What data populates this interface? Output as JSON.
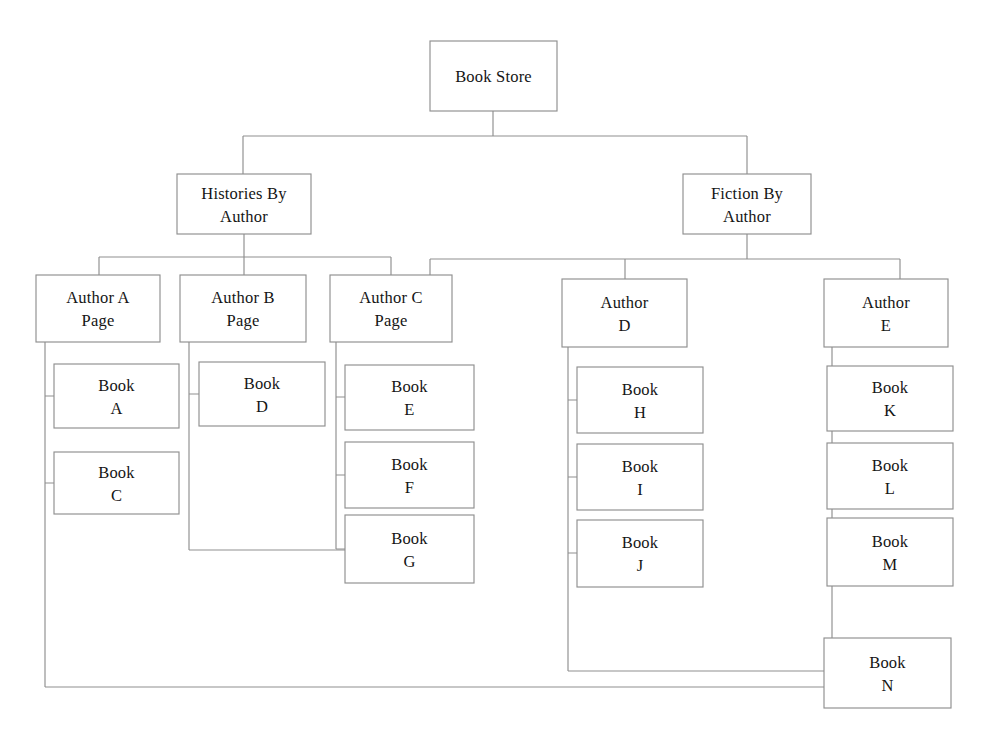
{
  "diagram": {
    "type": "tree-hierarchy",
    "background_color": "#ffffff",
    "box_fill_color": "#ffffff",
    "box_stroke_color": "#8f8f8f",
    "connector_color": "#8f8f8f",
    "text_color": "#151515",
    "nodes": [
      {
        "id": "book-store",
        "level": 0,
        "lines": [
          "Book Store"
        ],
        "x": 430,
        "y": 41,
        "w": 127,
        "h": 70
      },
      {
        "id": "histories-by-author",
        "level": 1,
        "lines": [
          "Histories By",
          "Author"
        ],
        "x": 177,
        "y": 174,
        "w": 134,
        "h": 60
      },
      {
        "id": "fiction-by-author",
        "level": 1,
        "lines": [
          "Fiction By",
          "Author"
        ],
        "x": 683,
        "y": 174,
        "w": 128,
        "h": 60
      },
      {
        "id": "author-a",
        "level": 2,
        "lines": [
          "Author A",
          "Page"
        ],
        "x": 36,
        "y": 275,
        "w": 124,
        "h": 67
      },
      {
        "id": "author-b",
        "level": 2,
        "lines": [
          "Author B",
          "Page"
        ],
        "x": 180,
        "y": 275,
        "w": 126,
        "h": 67
      },
      {
        "id": "author-c",
        "level": 2,
        "lines": [
          "Author C",
          "Page"
        ],
        "x": 330,
        "y": 275,
        "w": 122,
        "h": 67
      },
      {
        "id": "author-d",
        "level": 2,
        "lines": [
          "Author",
          "D"
        ],
        "x": 562,
        "y": 279,
        "w": 125,
        "h": 68
      },
      {
        "id": "author-e",
        "level": 2,
        "lines": [
          "Author",
          "E"
        ],
        "x": 824,
        "y": 279,
        "w": 124,
        "h": 68
      },
      {
        "id": "book-a",
        "level": 3,
        "lines": [
          "Book",
          "A"
        ],
        "x": 54,
        "y": 364,
        "w": 125,
        "h": 64
      },
      {
        "id": "book-c",
        "level": 3,
        "lines": [
          "Book",
          "C"
        ],
        "x": 54,
        "y": 452,
        "w": 125,
        "h": 62
      },
      {
        "id": "book-d",
        "level": 3,
        "lines": [
          "Book",
          "D"
        ],
        "x": 199,
        "y": 362,
        "w": 126,
        "h": 64
      },
      {
        "id": "book-e",
        "level": 3,
        "lines": [
          "Book",
          "E"
        ],
        "x": 345,
        "y": 365,
        "w": 129,
        "h": 65
      },
      {
        "id": "book-f",
        "level": 3,
        "lines": [
          "Book",
          "F"
        ],
        "x": 345,
        "y": 442,
        "w": 129,
        "h": 66
      },
      {
        "id": "book-g",
        "level": 3,
        "lines": [
          "Book",
          "G"
        ],
        "x": 345,
        "y": 515,
        "w": 129,
        "h": 68
      },
      {
        "id": "book-h",
        "level": 3,
        "lines": [
          "Book",
          "H"
        ],
        "x": 577,
        "y": 367,
        "w": 126,
        "h": 66
      },
      {
        "id": "book-i",
        "level": 3,
        "lines": [
          "Book",
          "I"
        ],
        "x": 577,
        "y": 444,
        "w": 126,
        "h": 66
      },
      {
        "id": "book-j",
        "level": 3,
        "lines": [
          "Book",
          "J"
        ],
        "x": 577,
        "y": 520,
        "w": 126,
        "h": 67
      },
      {
        "id": "book-k",
        "level": 3,
        "lines": [
          "Book",
          "K"
        ],
        "x": 827,
        "y": 366,
        "w": 126,
        "h": 65
      },
      {
        "id": "book-l",
        "level": 3,
        "lines": [
          "Book",
          "L"
        ],
        "x": 827,
        "y": 443,
        "w": 126,
        "h": 66
      },
      {
        "id": "book-m",
        "level": 3,
        "lines": [
          "Book",
          "M"
        ],
        "x": 827,
        "y": 518,
        "w": 126,
        "h": 68
      },
      {
        "id": "book-n",
        "level": 3,
        "lines": [
          "Book",
          "N"
        ],
        "x": 824,
        "y": 638,
        "w": 127,
        "h": 70
      }
    ],
    "connectors": [
      {
        "id": "root-to-level1-bus",
        "from": "book-store",
        "to": [
          "histories-by-author",
          "fiction-by-author"
        ],
        "path": "M 493 111 L 493 136 M 243 136 L 747 136 M 243 136 L 243 174 M 747 136 L 747 174"
      },
      {
        "id": "histories-to-authors-bus",
        "from": "histories-by-author",
        "to": [
          "author-a",
          "author-b",
          "author-c"
        ],
        "path": "M 244 234 L 244 257 M 99 257 L 391 257 M 99 257 L 99 275 M 244 257 L 244 275 M 391 257 L 391 275"
      },
      {
        "id": "fiction-to-authors-bus",
        "from": "fiction-by-author",
        "to": [
          "author-c",
          "author-d",
          "author-e"
        ],
        "path": "M 747 234 L 747 259 M 430 259 L 900 259 M 430 259 L 430 275 M 625 259 L 625 279 M 900 259 L 900 279"
      },
      {
        "id": "author-a-spine",
        "from": "author-a",
        "to": [
          "book-a",
          "book-c",
          "book-n"
        ],
        "path": "M 45 342 L 45 687 M 45 396 L 54 396 M 45 483 L 54 483 M 45 687 L 824 687"
      },
      {
        "id": "author-b-spine",
        "from": "author-b",
        "to": [
          "book-d",
          "book-g"
        ],
        "path": "M 189 342 L 189 550 M 189 394 L 199 394 M 189 550 L 345 550"
      },
      {
        "id": "author-c-spine",
        "from": "author-c",
        "to": [
          "book-e",
          "book-f",
          "book-g"
        ],
        "path": "M 336 342 L 336 549 M 336 397 L 345 397 M 336 475 L 345 475 M 336 549 L 345 549"
      },
      {
        "id": "author-d-spine",
        "from": "author-d",
        "to": [
          "book-h",
          "book-i",
          "book-j",
          "book-n"
        ],
        "path": "M 568 347 L 568 671 M 568 400 L 577 400 M 568 477 L 577 477 M 568 553 L 577 553 M 568 671 L 824 671"
      },
      {
        "id": "author-e-spine",
        "from": "author-e",
        "to": [
          "book-k",
          "book-l",
          "book-m",
          "book-n"
        ],
        "path": "M 832 347 L 832 655 M 832 398 L 827 398 M 832 476 L 827 476 M 832 552 L 827 552 M 832 655 L 824 655"
      }
    ]
  }
}
